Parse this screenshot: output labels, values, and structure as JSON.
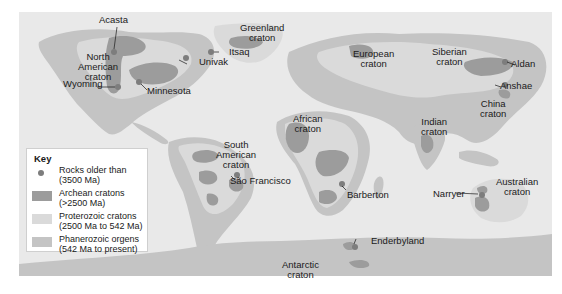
{
  "legend": {
    "title": "Key",
    "items": [
      {
        "label_line1": "Rocks older than",
        "label_line2": "(3500 Ma)",
        "symbol": "dot",
        "color": "#7d7d7d"
      },
      {
        "label_line1": "Archean cratons",
        "label_line2": "(>2500 Ma)",
        "symbol": "swatch",
        "color": "#9c9c9c"
      },
      {
        "label_line1": "Proterozoic cratons",
        "label_line2": "(2500 Ma to 542 Ma)",
        "symbol": "swatch",
        "color": "#dadada"
      },
      {
        "label_line1": "Phanerozoic orgens",
        "label_line2": "(542 Ma to present)",
        "symbol": "swatch",
        "color": "#c4c4c4"
      }
    ]
  },
  "colors": {
    "ocean": "#e9e9e9",
    "proterozoic": "#dadada",
    "phanerozoic": "#c4c4c4",
    "archean": "#9c9c9c",
    "old_rock": "#7d7d7d"
  },
  "cratons": [
    {
      "id": "north-american",
      "line1": "North",
      "line2": "American",
      "line3": "craton"
    },
    {
      "id": "greenland",
      "line1": "Greenland",
      "line2": "craton"
    },
    {
      "id": "european",
      "line1": "European",
      "line2": "craton"
    },
    {
      "id": "siberian",
      "line1": "Siberian",
      "line2": "craton"
    },
    {
      "id": "african",
      "line1": "African",
      "line2": "craton"
    },
    {
      "id": "indian",
      "line1": "Indian",
      "line2": "craton"
    },
    {
      "id": "china",
      "line1": "China",
      "line2": "craton"
    },
    {
      "id": "south-american",
      "line1": "South",
      "line2": "American",
      "line3": "craton"
    },
    {
      "id": "australian",
      "line1": "Australian",
      "line2": "craton"
    },
    {
      "id": "antarctic",
      "line1": "Antarctic",
      "line2": "craton"
    }
  ],
  "sites": {
    "acasta": "Acasta",
    "wyoming": "Wyoming",
    "minnesota": "Minnesota",
    "univak": "Univak",
    "itsaq": "Itsaq",
    "aldan": "Aldan",
    "anshae": "Anshae",
    "sao_francisco": "São Francisco",
    "barberton": "Barberton",
    "narryer": "Narryer",
    "enderbyland": "Enderbyland"
  }
}
